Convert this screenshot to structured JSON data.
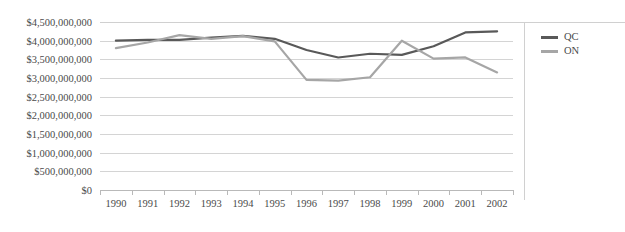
{
  "chart_data": {
    "type": "line",
    "title": "",
    "xlabel": "",
    "ylabel": "",
    "categories": [
      "1990",
      "1991",
      "1992",
      "1993",
      "1994",
      "1995",
      "1996",
      "1997",
      "1998",
      "1999",
      "2000",
      "2001",
      "2002"
    ],
    "series": [
      {
        "name": "QC",
        "color": "#595959",
        "values": [
          4000000000,
          4020000000,
          4020000000,
          4080000000,
          4130000000,
          4050000000,
          3750000000,
          3550000000,
          3650000000,
          3620000000,
          3850000000,
          4220000000,
          4250000000
        ]
      },
      {
        "name": "ON",
        "color": "#a6a6a6",
        "values": [
          3800000000,
          3950000000,
          4150000000,
          4050000000,
          4120000000,
          3980000000,
          2950000000,
          2930000000,
          3020000000,
          4000000000,
          3520000000,
          3550000000,
          3150000000
        ]
      }
    ],
    "ylim": [
      0,
      4500000000
    ],
    "y_tick_values": [
      4500000000,
      4000000000,
      3500000000,
      3000000000,
      2500000000,
      2000000000,
      1500000000,
      1000000000,
      500000000,
      0
    ],
    "y_tick_labels": [
      "$4,500,000,000",
      "$4,000,000,000",
      "$3,500,000,000",
      "$3,000,000,000",
      "$2,500,000,000",
      "$2,000,000,000",
      "$1,500,000,000",
      "$1,000,000,000",
      "$500,000,000",
      "$0"
    ],
    "grid": true,
    "legend_position": "right",
    "legend_entries": [
      {
        "label": "QC",
        "color": "#595959"
      },
      {
        "label": "ON",
        "color": "#a6a6a6"
      }
    ]
  }
}
